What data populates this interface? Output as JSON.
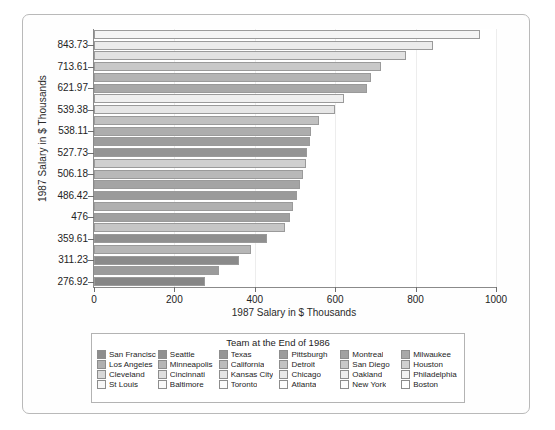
{
  "chart_data": {
    "type": "bar",
    "orientation": "horizontal",
    "title": "",
    "xlabel": "1987 Salary in $ Thousands",
    "ylabel": "1987 Salary in $ Thousands",
    "xlim": [
      0,
      1000
    ],
    "xticks": [
      0,
      200,
      400,
      600,
      800,
      1000
    ],
    "grid": true,
    "legend_position": "bottom",
    "legend_title": "Team at the End of 1986",
    "ytick_labels": [
      "843.73",
      "713.61",
      "621.97",
      "539.38",
      "538.11",
      "527.73",
      "506.18",
      "486.42",
      "476",
      "359.61",
      "311.23",
      "276.92"
    ],
    "categories": [
      "San Francisco",
      "Seattle",
      "Texas",
      "Pittsburgh",
      "Montreal",
      "Milwaukee",
      "Los Angeles",
      "Minneapolis",
      "California",
      "Detroit",
      "San Diego",
      "Houston",
      "Cleveland",
      "Cincinnati",
      "Kansas City",
      "Chicago",
      "Oakland",
      "Philadelphia",
      "St Louis",
      "Baltimore",
      "Toronto",
      "Atlanta",
      "New York",
      "Boston"
    ],
    "values": [
      960,
      843.73,
      775,
      713.61,
      690,
      680,
      621.97,
      600,
      560,
      539.38,
      538.11,
      530,
      527.73,
      520,
      512,
      506.18,
      495,
      486.42,
      476,
      430,
      390,
      359.61,
      311.23,
      276.92
    ],
    "bar_colors": [
      "#f4f4f4",
      "#ebebeb",
      "#e2e2e2",
      "#c8c8c8",
      "#b4b4b4",
      "#a8a8a8",
      "#efefef",
      "#e6e6e6",
      "#c0c0c0",
      "#adadad",
      "#9d9d9d",
      "#949494",
      "#cfcfcf",
      "#b8b8b8",
      "#a4a4a4",
      "#9a9a9a",
      "#b0b0b0",
      "#a0a0a0",
      "#c6c6c6",
      "#8f8f8f",
      "#b6b6b6",
      "#8a8a8a",
      "#9b9b9b",
      "#868686"
    ],
    "legend_rows": [
      [
        {
          "label": "San Francisco",
          "color": "#8d8d8d"
        },
        {
          "label": "Seattle",
          "color": "#909090"
        },
        {
          "label": "Texas",
          "color": "#969696"
        },
        {
          "label": "Pittsburgh",
          "color": "#9c9c9c"
        },
        {
          "label": "Montreal",
          "color": "#a2a2a2"
        },
        {
          "label": "Milwaukee",
          "color": "#a8a8a8"
        }
      ],
      [
        {
          "label": "Los Angeles",
          "color": "#b0b0b0"
        },
        {
          "label": "Minneapolis",
          "color": "#b6b6b6"
        },
        {
          "label": "California",
          "color": "#bcbcbc"
        },
        {
          "label": "Detroit",
          "color": "#c2c2c2"
        },
        {
          "label": "San Diego",
          "color": "#c8c8c8"
        },
        {
          "label": "Houston",
          "color": "#d0d0d0"
        }
      ],
      [
        {
          "label": "Cleveland",
          "color": "#d8d8d8"
        },
        {
          "label": "Cincinnati",
          "color": "#dedede"
        },
        {
          "label": "Kansas City",
          "color": "#e4e4e4"
        },
        {
          "label": "Chicago",
          "color": "#e9e9e9"
        },
        {
          "label": "Oakland",
          "color": "#eeeeee"
        },
        {
          "label": "Philadelphia",
          "color": "#f3f3f3"
        }
      ],
      [
        {
          "label": "St Louis",
          "color": "#f7f7f7"
        },
        {
          "label": "Baltimore",
          "color": "#f9f9f9"
        },
        {
          "label": "Toronto",
          "color": "#fbfbfb"
        },
        {
          "label": "Atlanta",
          "color": "#fcfcfc"
        },
        {
          "label": "New York",
          "color": "#fdfdfd"
        },
        {
          "label": "Boston",
          "color": "#ffffff"
        }
      ]
    ]
  },
  "axes": {
    "y_title": "1987 Salary in $ Thousands",
    "x_title": "1987 Salary in $ Thousands"
  },
  "legend": {
    "title": "Team at the End of 1986"
  }
}
